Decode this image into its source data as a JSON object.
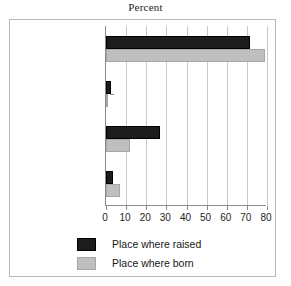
{
  "chart_data": {
    "type": "bar",
    "orientation": "horizontal",
    "title": "Percent",
    "xlabel": "",
    "ylabel": "",
    "xlim": [
      0,
      80
    ],
    "xticks": [
      0,
      10,
      20,
      30,
      40,
      50,
      60,
      70,
      80
    ],
    "xtick_labels": [
      "0",
      "10",
      "20",
      "30",
      "40",
      "50",
      "60",
      "70",
      "80"
    ],
    "grid": true,
    "grid_axis": "x",
    "legend_position": "bottom-left",
    "categories": [
      "Mexico",
      "Other foreign",
      "Rio Grande Valley",
      "Other U.S."
    ],
    "series": [
      {
        "name": "Place where raised",
        "color": "#1c1c1c",
        "values": [
          71.5,
          2.5,
          27.0,
          3.7
        ]
      },
      {
        "name": "Place where born",
        "color": "#bfbfbf",
        "values": [
          79.0,
          0.5,
          12.0,
          6.8
        ]
      }
    ]
  },
  "title": {
    "text": "Percent"
  },
  "axis": {
    "tick_labels": [
      "0",
      "10",
      "20",
      "30",
      "40",
      "50",
      "60",
      "70",
      "80"
    ]
  },
  "categories": [
    {
      "label": "Mexico"
    },
    {
      "label": "Other foreign"
    },
    {
      "label": "Rio Grande Valley"
    },
    {
      "label": "Other U.S."
    }
  ],
  "legend": {
    "items": [
      {
        "label": "Place where raised",
        "swatch": "black-swatch-icon"
      },
      {
        "label": "Place where born",
        "swatch": "gray-swatch-icon"
      }
    ]
  }
}
